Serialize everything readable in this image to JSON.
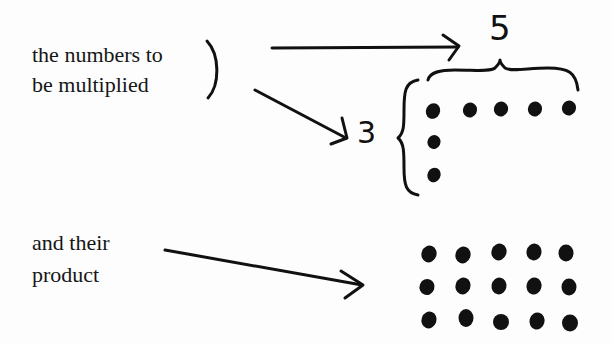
{
  "diagram": {
    "type": "multiplication-as-array",
    "labels": {
      "factors_line1": "the numbers to",
      "factors_line2": "be multiplied",
      "product_line1": "and their",
      "product_line2": "product"
    },
    "factors": {
      "columns": "5",
      "rows": "3"
    },
    "factor_layout": {
      "top_row_dots": 5,
      "side_column_dots": 3
    },
    "product_array": {
      "rows": 3,
      "columns": 5,
      "total_dots": 15
    },
    "colors": {
      "ink": "#111111",
      "background": "#fdfdfd"
    }
  }
}
